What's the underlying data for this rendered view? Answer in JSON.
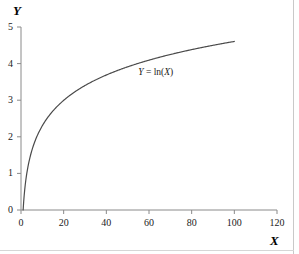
{
  "figure": {
    "background_color": "#ffffff",
    "border_color": "#c9c9c9",
    "axis_color": "#7a7a7a",
    "curve_color": "#4a4a4a",
    "text_color": "#000000"
  },
  "chart_data": {
    "type": "line",
    "title": "",
    "subtitle": "",
    "xlabel": "X",
    "ylabel": "Y",
    "xlim": [
      0,
      120
    ],
    "ylim": [
      0,
      5
    ],
    "xticks": [
      0,
      20,
      40,
      60,
      80,
      100,
      120
    ],
    "yticks": [
      0,
      1,
      2,
      3,
      4,
      5
    ],
    "xtick_labels": [
      "0",
      "20",
      "40",
      "60",
      "80",
      "100",
      "120"
    ],
    "ytick_labels": [
      "0",
      "1",
      "2",
      "3",
      "4",
      "5"
    ],
    "grid": false,
    "legend": null,
    "annotations": [
      {
        "text": "Y = ln(X)",
        "parts": {
          "lhs": "Y",
          "operator": " = ",
          "func": "ln(",
          "arg": "X",
          "close": ")"
        },
        "x": 55,
        "y": 3.75
      }
    ],
    "series": [
      {
        "name": "Y = ln(X)",
        "formula": "Y = ln(X)",
        "x_start": 1,
        "x_end": 100,
        "x": [
          1,
          2,
          3,
          4,
          5,
          6,
          8,
          10,
          12,
          15,
          18,
          20,
          25,
          30,
          35,
          40,
          45,
          50,
          55,
          60,
          65,
          70,
          75,
          80,
          85,
          90,
          95,
          100
        ],
        "y": [
          0.0,
          0.69,
          1.1,
          1.39,
          1.61,
          1.79,
          2.08,
          2.3,
          2.48,
          2.71,
          2.89,
          3.0,
          3.22,
          3.4,
          3.56,
          3.69,
          3.81,
          3.91,
          4.01,
          4.09,
          4.17,
          4.25,
          4.32,
          4.38,
          4.44,
          4.5,
          4.55,
          4.61
        ]
      }
    ]
  },
  "labels": {
    "y_axis_title": "Y",
    "x_axis_title": "X"
  }
}
